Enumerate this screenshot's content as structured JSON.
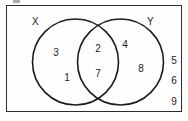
{
  "figure": {
    "type": "venn-diagram",
    "set_count": 2,
    "stroke_color": "#1c1c1c",
    "background_color": "#fdfdfd"
  },
  "universal_set": {
    "shape": "rectangle",
    "label": ""
  },
  "sets": [
    {
      "name": "X",
      "label": "X"
    },
    {
      "name": "Y",
      "label": "Y"
    }
  ],
  "regions": {
    "left_only": {
      "name": "X only",
      "items": [
        "3",
        "1"
      ]
    },
    "intersection": {
      "name": "X and Y",
      "items": [
        "2",
        "7"
      ]
    },
    "right_only": {
      "name": "Y only",
      "items": [
        "4",
        "8"
      ]
    },
    "outside": {
      "name": "Neither X nor Y",
      "items": [
        "5",
        "6",
        "9"
      ]
    }
  },
  "artifact": {
    "top_sliver": ""
  }
}
